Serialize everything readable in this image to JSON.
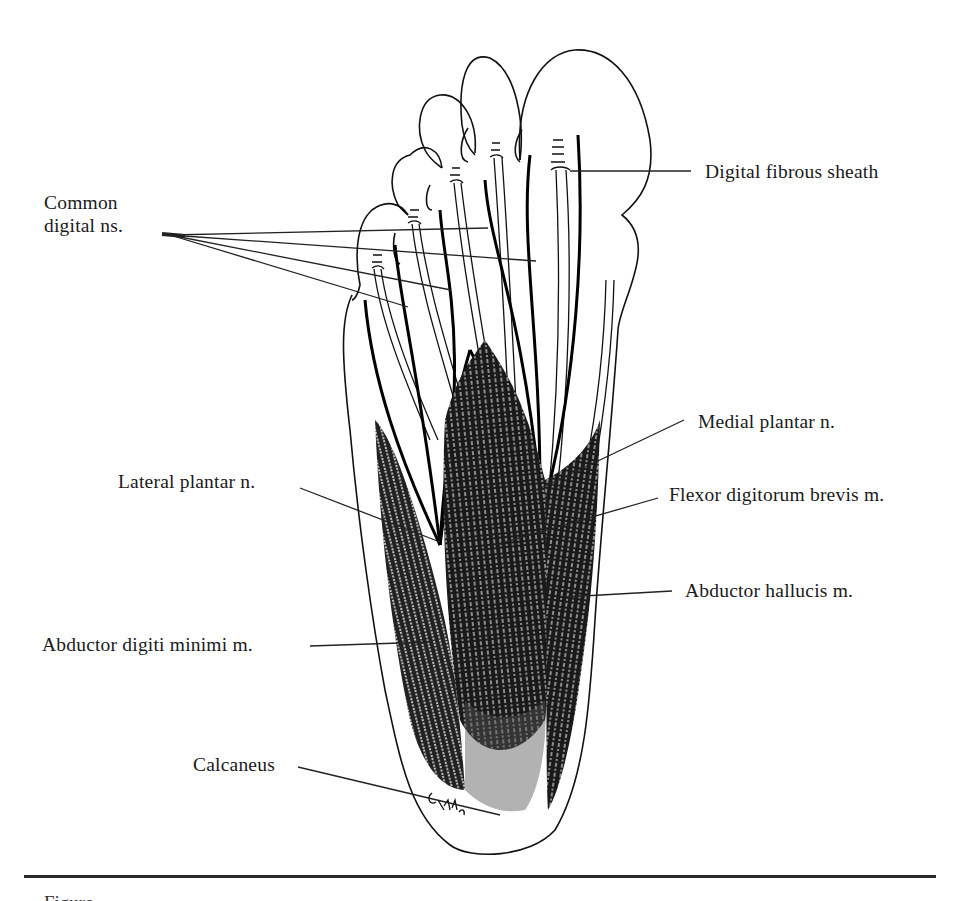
{
  "figure": {
    "signature": "artist-signature",
    "caption_partial": "Figure",
    "labels": {
      "common_digital_ns_line1": "Common",
      "common_digital_ns_line2": "digital ns.",
      "digital_fibrous_sheath": "Digital fibrous sheath",
      "medial_plantar_n": "Medial plantar n.",
      "lateral_plantar_n": "Lateral plantar n.",
      "flexor_digitorum_brevis_m": "Flexor digitorum brevis m.",
      "abductor_hallucis_m": "Abductor hallucis m.",
      "abductor_digiti_minimi_m": "Abductor digiti minimi m.",
      "calcaneus": "Calcaneus"
    },
    "colors": {
      "ink": "#111111",
      "paper": "#ffffff"
    }
  }
}
